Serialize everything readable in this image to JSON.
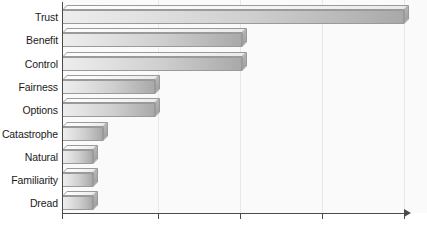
{
  "chart_data": {
    "type": "bar",
    "orientation": "horizontal",
    "title": "",
    "subtitle": "",
    "xlabel": "",
    "ylabel": "",
    "grid": true,
    "legend": null,
    "xlim": [
      0,
      4.2
    ],
    "xticks": [
      0,
      1,
      2,
      3,
      4
    ],
    "xticklabels": [
      "",
      "",
      "",
      "",
      ""
    ],
    "categories": [
      "Trust",
      "Benefit",
      "Control",
      "Fairness",
      "Options",
      "Catastrophe",
      "Natural",
      "Familiarity",
      "Dread"
    ],
    "values": [
      4.18,
      2.2,
      2.2,
      1.14,
      1.14,
      0.5,
      0.38,
      0.38,
      0.38
    ],
    "bars": [
      {
        "label": "Trust",
        "value": 4.18
      },
      {
        "label": "Benefit",
        "value": 2.2
      },
      {
        "label": "Control",
        "value": 2.2
      },
      {
        "label": "Fairness",
        "value": 1.14
      },
      {
        "label": "Options",
        "value": 1.14
      },
      {
        "label": "Catastrophe",
        "value": 0.5
      },
      {
        "label": "Natural",
        "value": 0.38
      },
      {
        "label": "Familiarity",
        "value": 0.38
      },
      {
        "label": "Dread",
        "value": 0.38
      }
    ],
    "colors": {
      "bar_light": "#ededed",
      "bar_dark": "#a9a9a9",
      "bar_outline": "#9a9a9a",
      "bar_top": "#f6f6f6",
      "bar_side": "#a0a0a0",
      "axis": "#4a4a4a",
      "gridline": "#e8e8e8",
      "plot_background": "#fafafa",
      "label_text": "#1a1a1a"
    }
  }
}
